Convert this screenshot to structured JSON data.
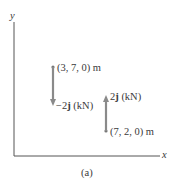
{
  "figure": {
    "caption": "(a)",
    "axes": {
      "x_label": "x",
      "y_label": "y"
    },
    "forces": [
      {
        "point_label": "(3, 7, 0) m",
        "force_prefix": "−2",
        "force_unit_vector": "j",
        "force_unit": " (kN)",
        "direction": "down"
      },
      {
        "point_label": "(7, 2, 0) m",
        "force_prefix": "2",
        "force_unit_vector": "j",
        "force_unit": " (kN)",
        "direction": "up"
      }
    ],
    "colors": {
      "axis": "#555555",
      "arrow": "#8a8a8a",
      "text": "#3a3a3a"
    }
  }
}
